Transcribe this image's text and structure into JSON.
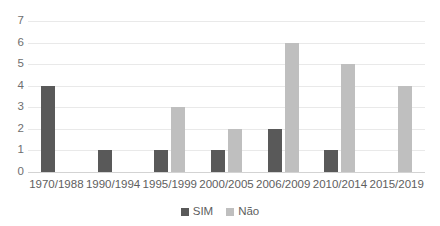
{
  "chart_data": {
    "type": "bar",
    "title": "",
    "subtitle": "",
    "xlabel": "",
    "ylabel": "",
    "categories": [
      "1970/1988",
      "1990/1994",
      "1995/1999",
      "2000/2005",
      "2006/2009",
      "2010/2014",
      "2015/2019"
    ],
    "series": [
      {
        "name": "SIM",
        "color": "#595959",
        "values": [
          4,
          1,
          1,
          1,
          2,
          1,
          0
        ]
      },
      {
        "name": "Não",
        "color": "#bfbfbf",
        "values": [
          0,
          0,
          3,
          2,
          6,
          5,
          4
        ]
      }
    ],
    "ylim": [
      0,
      7
    ],
    "ytick_step": 1,
    "yticks": [
      "7",
      "6",
      "5",
      "4",
      "3",
      "2",
      "1",
      "0"
    ],
    "grid": true,
    "grid_axis": "y",
    "legend_position": "bottom",
    "background_color": "#ffffff",
    "gridline_color": "#e9e9e9",
    "axis_color": "#d3d3d3",
    "tick_label_color": "#5e5e5e"
  },
  "legend": {
    "items": [
      {
        "label": "SIM",
        "color": "#595959"
      },
      {
        "label": "Não",
        "color": "#bfbfbf"
      }
    ]
  }
}
